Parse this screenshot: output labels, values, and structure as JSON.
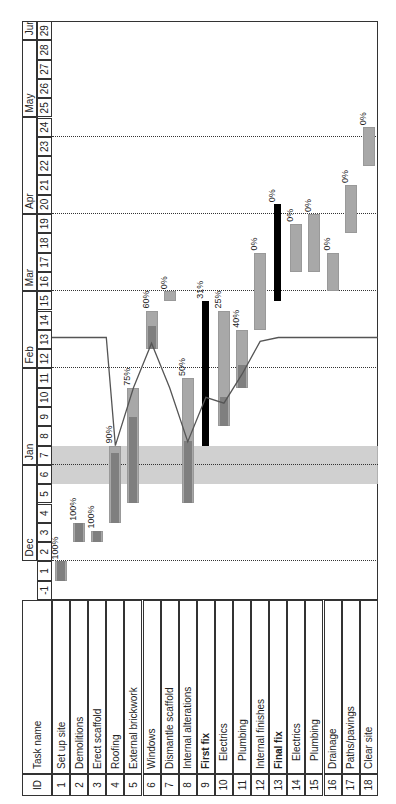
{
  "chart_data": {
    "type": "gantt",
    "title": "",
    "orientation": "rotated -90deg",
    "columns": [
      "ID",
      "Task name"
    ],
    "timeline": {
      "unit": "week",
      "weeks": [
        -1,
        1,
        2,
        3,
        4,
        5,
        6,
        7,
        8,
        9,
        10,
        11,
        12,
        13,
        14,
        15,
        16,
        17,
        18,
        19,
        20,
        21,
        22,
        23,
        24,
        25,
        26,
        27,
        28,
        29
      ],
      "months": [
        {
          "label": "Dec",
          "start_week": 2,
          "end_week": 6
        },
        {
          "label": "Jan",
          "start_week": 7,
          "end_week": 11
        },
        {
          "label": "Feb",
          "start_week": 12,
          "end_week": 15
        },
        {
          "label": "Mar",
          "start_week": 16,
          "end_week": 19
        },
        {
          "label": "Apr",
          "start_week": 20,
          "end_week": 24
        },
        {
          "label": "May",
          "start_week": 25,
          "end_week": 28
        },
        {
          "label": "Jun",
          "start_week": 29,
          "end_week": 29
        }
      ],
      "holiday_shading_weeks": [
        6,
        7
      ],
      "status_date_week": 12,
      "dotted_verticals_weeks": [
        2,
        7,
        12,
        16,
        20,
        24
      ]
    },
    "tasks": [
      {
        "id": "1",
        "name": "Set up site",
        "start": 1,
        "end": 2,
        "pct": "100%",
        "summary": false
      },
      {
        "id": "2",
        "name": "Demolitions",
        "start": 3,
        "end": 4,
        "pct": "100%",
        "summary": false
      },
      {
        "id": "3",
        "name": "Erect scaffold",
        "start": 3,
        "end": 3.6,
        "pct": "100%",
        "summary": false
      },
      {
        "id": "4",
        "name": "Roofing",
        "start": 4,
        "end": 8,
        "pct": "90%",
        "summary": false
      },
      {
        "id": "5",
        "name": "External brickwork",
        "start": 5,
        "end": 11,
        "pct": "75%",
        "summary": false
      },
      {
        "id": "6",
        "name": "Windows",
        "start": 13,
        "end": 15,
        "pct": "60%",
        "summary": false
      },
      {
        "id": "7",
        "name": "Dismantle scaffold",
        "start": 15.5,
        "end": 16,
        "pct": "0%",
        "summary": false
      },
      {
        "id": "8",
        "name": "Internal alterations",
        "start": 5,
        "end": 11.5,
        "pct": "50%",
        "summary": false
      },
      {
        "id": "9",
        "name": "First fix",
        "start": 8,
        "end": 15.5,
        "pct": "31%",
        "summary": true
      },
      {
        "id": "10",
        "name": "Electrics",
        "start": 9,
        "end": 15,
        "pct": "25%",
        "summary": false
      },
      {
        "id": "11",
        "name": "Plumbing",
        "start": 11,
        "end": 14,
        "pct": "40%",
        "summary": false
      },
      {
        "id": "12",
        "name": "Internal finishes",
        "start": 14,
        "end": 18,
        "pct": "0%",
        "summary": false
      },
      {
        "id": "13",
        "name": "Final fix",
        "start": 15.5,
        "end": 20.5,
        "pct": "0%",
        "summary": true
      },
      {
        "id": "14",
        "name": "Electrics",
        "start": 17,
        "end": 19.5,
        "pct": "0%",
        "summary": false
      },
      {
        "id": "15",
        "name": "Plumbing",
        "start": 17,
        "end": 20,
        "pct": "0%",
        "summary": false
      },
      {
        "id": "16",
        "name": "Drainage",
        "start": 16,
        "end": 18,
        "pct": "0%",
        "summary": false
      },
      {
        "id": "17",
        "name": "Paths/pavings",
        "start": 19,
        "end": 21.5,
        "pct": "0%",
        "summary": false
      },
      {
        "id": "18",
        "name": "Clear site",
        "start": 22.5,
        "end": 24.5,
        "pct": "0%",
        "summary": false
      }
    ]
  },
  "header": {
    "id_label": "ID",
    "name_label": "Task name"
  },
  "colors": {
    "bar": "#a8a8a8",
    "bar_progress": "#7f7f7f",
    "summary": "#000000",
    "holiday": "#c8c8c8",
    "grid": "#333333",
    "line": "#555555"
  }
}
